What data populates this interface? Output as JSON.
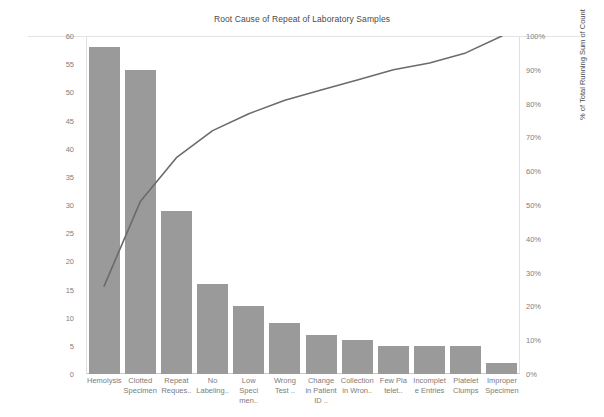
{
  "chart_data": {
    "type": "bar",
    "title": "Root Cause of Repeat of Laboratory Samples",
    "xlabel": "",
    "ylabel": "Count",
    "y2label": "% of Total Running Sum of Count",
    "ylim": [
      0,
      60
    ],
    "y2lim": [
      0,
      100
    ],
    "grid": false,
    "legend": false,
    "categories": [
      "Hemolysis",
      "Clotted Specimen",
      "Repeat Reques..",
      "No Labeling..",
      "Low Speci men..",
      "Wrong Test ..",
      "Change in Patient ID ..",
      "Collection in Wron..",
      "Few Pla telet..",
      "Incomplet e Entries",
      "Platelet Clumps",
      "Improper Specimen"
    ],
    "series": [
      {
        "name": "Count",
        "type": "bar",
        "axis": "left",
        "color": "#9a9a9a",
        "values": [
          58,
          54,
          29,
          16,
          12,
          9,
          7,
          6,
          5,
          5,
          5,
          2
        ]
      },
      {
        "name": "% of Total Running Sum of Count",
        "type": "line",
        "axis": "right",
        "color": "#6b6b6b",
        "values": [
          26,
          51,
          64,
          72,
          77,
          81,
          84,
          87,
          90,
          92,
          95,
          100
        ]
      }
    ],
    "y_left_ticks": [
      "0",
      "5",
      "10",
      "15",
      "20",
      "25",
      "30",
      "35",
      "40",
      "45",
      "50",
      "55",
      "60"
    ],
    "y_right_ticks": [
      "0%",
      "10%",
      "20%",
      "30%",
      "40%",
      "50%",
      "60%",
      "70%",
      "80%",
      "90%",
      "100%"
    ]
  }
}
